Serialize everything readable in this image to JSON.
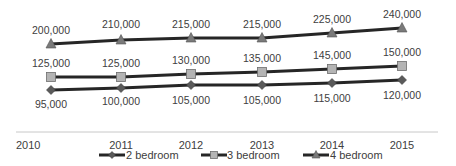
{
  "chart_data": {
    "type": "line",
    "title": "",
    "xlabel": "",
    "ylabel": "",
    "x": [
      "2010",
      "2011",
      "2012",
      "2013",
      "2014",
      "2015"
    ],
    "series": [
      {
        "name": "2 bedroom",
        "marker": "diamond",
        "values": [
          95000,
          100000,
          105000,
          105000,
          115000,
          120000
        ],
        "labels": [
          "95,000",
          "100,000",
          "105,000",
          "105,000",
          "115,000",
          "120,000"
        ]
      },
      {
        "name": "3 bedroom",
        "marker": "square",
        "values": [
          125000,
          125000,
          130000,
          135000,
          145000,
          150000
        ],
        "labels": [
          "125,000",
          "125,000",
          "130,000",
          "135,000",
          "145,000",
          "150,000"
        ]
      },
      {
        "name": "4 bedroom",
        "marker": "triangle",
        "values": [
          200000,
          210000,
          215000,
          215000,
          225000,
          240000
        ],
        "labels": [
          "200,000",
          "210,000",
          "215,000",
          "215,000",
          "225,000",
          "240,000"
        ]
      }
    ],
    "grid": false,
    "legend_position": "bottom",
    "y_axis_visible": false
  },
  "colors": {
    "line": "#262626",
    "diamond_marker": "#5a5a5a",
    "square_marker": "#b4b4b4",
    "triangle_marker": "#7a7a7a",
    "axis": "#bfbfbf"
  }
}
